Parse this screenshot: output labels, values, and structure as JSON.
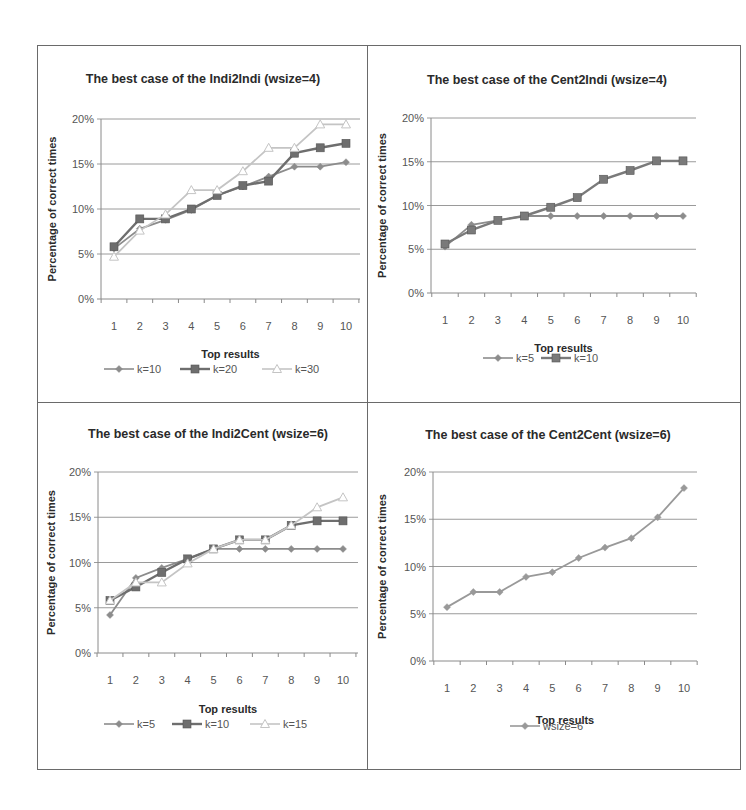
{
  "chart_data": [
    {
      "type": "line",
      "title": "The best case of the Indi2Indi (wsize=4)",
      "xlabel": "Top results",
      "ylabel": "Percentage of correct times",
      "x": [
        1,
        2,
        3,
        4,
        5,
        6,
        7,
        8,
        9,
        10
      ],
      "yticks": [
        "0%",
        "5%",
        "10%",
        "15%",
        "20%"
      ],
      "ylim": [
        0,
        20
      ],
      "grid": true,
      "legend_position": "bottom",
      "series": [
        {
          "name": "k=10",
          "marker": "diamond",
          "color": "#8c8c8c",
          "values": [
            5.6,
            7.8,
            8.8,
            9.9,
            11.5,
            12.5,
            13.6,
            14.7,
            14.7,
            15.2
          ]
        },
        {
          "name": "k=20",
          "marker": "square",
          "color": "#6e6e6e",
          "values": [
            5.8,
            8.9,
            8.9,
            10.0,
            11.5,
            12.6,
            13.1,
            16.2,
            16.8,
            17.3
          ]
        },
        {
          "name": "k=30",
          "marker": "triangle",
          "color": "#c4c4c4",
          "values": [
            4.7,
            7.6,
            9.4,
            12.1,
            12.1,
            14.2,
            16.8,
            16.8,
            19.4,
            19.4
          ]
        }
      ]
    },
    {
      "type": "line",
      "title": "The best case of the Cent2Indi  (wsize=4)",
      "xlabel": "Top results",
      "ylabel": "Percentage of correct  times",
      "x": [
        1,
        2,
        3,
        4,
        5,
        6,
        7,
        8,
        9,
        10
      ],
      "yticks": [
        "0%",
        "5%",
        "10%",
        "15%",
        "20%"
      ],
      "ylim": [
        0,
        20
      ],
      "grid": true,
      "legend_position": "bottom",
      "series": [
        {
          "name": "k=5",
          "marker": "diamond",
          "color": "#8c8c8c",
          "values": [
            5.3,
            7.8,
            8.3,
            8.8,
            8.8,
            8.8,
            8.8,
            8.8,
            8.8,
            8.8
          ]
        },
        {
          "name": "k=10",
          "marker": "square",
          "color": "#7a7a7a",
          "values": [
            5.6,
            7.2,
            8.3,
            8.8,
            9.8,
            10.9,
            13.0,
            14.0,
            15.1,
            15.1
          ]
        }
      ]
    },
    {
      "type": "line",
      "title": "The best case of the Indi2Cent (wsize=6)",
      "xlabel": "Top results",
      "ylabel": "Percentage of correct  times",
      "x": [
        1,
        2,
        3,
        4,
        5,
        6,
        7,
        8,
        9,
        10
      ],
      "yticks": [
        "0%",
        "5%",
        "10%",
        "15%",
        "20%"
      ],
      "ylim": [
        0,
        20
      ],
      "grid": true,
      "legend_position": "bottom",
      "series": [
        {
          "name": "k=5",
          "marker": "diamond",
          "color": "#8c8c8c",
          "values": [
            4.2,
            8.3,
            9.4,
            10.4,
            11.5,
            11.5,
            11.5,
            11.5,
            11.5,
            11.5
          ]
        },
        {
          "name": "k=10",
          "marker": "square",
          "color": "#6e6e6e",
          "values": [
            5.8,
            7.3,
            8.9,
            10.4,
            11.5,
            12.5,
            12.5,
            14.1,
            14.6,
            14.6
          ]
        },
        {
          "name": "k=15",
          "marker": "triangle",
          "color": "#c4c4c4",
          "values": [
            5.8,
            7.8,
            7.8,
            9.9,
            11.5,
            12.5,
            12.5,
            14.1,
            16.1,
            17.2
          ]
        }
      ]
    },
    {
      "type": "line",
      "title": "The best case of the Cent2Cent (wsize=6)",
      "xlabel": "Top results",
      "ylabel": "Percentage of correct times",
      "x": [
        1,
        2,
        3,
        4,
        5,
        6,
        7,
        8,
        9,
        10
      ],
      "yticks": [
        "0%",
        "5%",
        "10%",
        "15%",
        "20%"
      ],
      "ylim": [
        0,
        20
      ],
      "grid": true,
      "legend_position": "bottom",
      "series": [
        {
          "name": "wsize=6",
          "marker": "diamond",
          "color": "#999999",
          "values": [
            5.7,
            7.3,
            7.3,
            8.9,
            9.4,
            10.9,
            12.0,
            13.0,
            15.2,
            18.3
          ]
        }
      ]
    }
  ],
  "layout": {
    "panels": [
      {
        "left": 101,
        "right": 360,
        "y0": 299,
        "y20": 119,
        "x1": 114,
        "x10": 346,
        "title_x": 203,
        "title_y": 83,
        "ylabel_x": 56,
        "xlabel_y": 358,
        "legend_y": 373,
        "legend_x": [
          104,
          180,
          262
        ],
        "tick_y": 330
      },
      {
        "left": 431,
        "right": 696,
        "y0": 293,
        "y20": 118,
        "x1": 445,
        "x10": 683,
        "title_x": 547,
        "title_y": 84,
        "ylabel_x": 386,
        "xlabel_y": 352,
        "legend_x": [
          483,
          541
        ],
        "legend_y": 362,
        "tick_y": 324
      },
      {
        "left": 98,
        "right": 358,
        "y0": 653,
        "y20": 472,
        "x1": 110,
        "x10": 343,
        "title_x": 208,
        "title_y": 438,
        "ylabel_x": 55,
        "xlabel_y": 713,
        "legend_x": [
          104,
          172,
          250
        ],
        "legend_y": 728,
        "tick_y": 684
      },
      {
        "left": 433,
        "right": 697,
        "y0": 661,
        "y20": 472,
        "x1": 447,
        "x10": 684,
        "title_x": 548,
        "title_y": 439,
        "ylabel_x": 386,
        "xlabel_y": 724,
        "legend_x": [
          510
        ],
        "legend_y": 730,
        "tick_y": 692
      }
    ]
  }
}
